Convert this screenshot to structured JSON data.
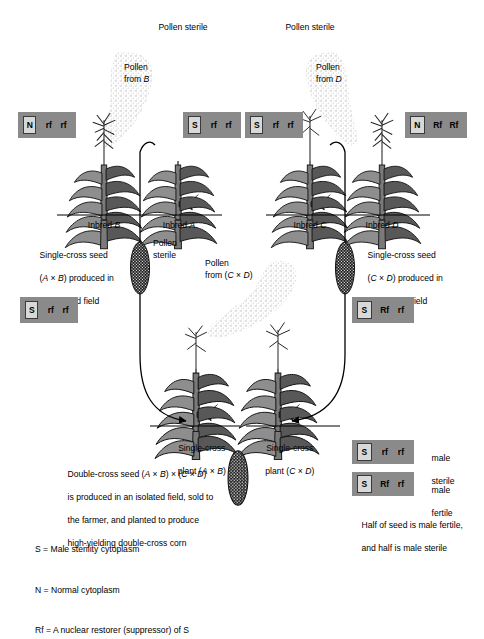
{
  "figure": {
    "type": "diagram"
  },
  "top_row": {
    "pollen_sterile_left": "Pollen sterile",
    "pollen_sterile_right": "Pollen sterile",
    "pollen_from_b": "Pollen\nfrom B",
    "pollen_from_d": "Pollen\nfrom D",
    "genotypes": [
      {
        "name": "inbred-b-genotype",
        "cytoplasm": "N",
        "allele1": "rf",
        "allele2": "rf"
      },
      {
        "name": "inbred-a-genotype",
        "cytoplasm": "S",
        "allele1": "rf",
        "allele2": "rf"
      },
      {
        "name": "inbred-c-genotype",
        "cytoplasm": "S",
        "allele1": "rf",
        "allele2": "rf"
      },
      {
        "name": "inbred-d-genotype",
        "cytoplasm": "N",
        "allele1": "Rf",
        "allele2": "Rf"
      }
    ],
    "plant_labels": [
      {
        "prefix": "Inbred ",
        "italic": "B"
      },
      {
        "prefix": "Inbred ",
        "italic": "A"
      },
      {
        "prefix": "Inbred ",
        "italic": "C"
      },
      {
        "prefix": "Inbred ",
        "italic": "D"
      }
    ]
  },
  "middle_row": {
    "seed_note_left_l1": "Single-cross seed",
    "seed_note_left_l2": "(A × B) produced in",
    "seed_note_left_l3": "an isolated field",
    "seed_note_right_l1": "Single-cross seed",
    "seed_note_right_l2": "(C × D) produced in",
    "seed_note_right_l3": "an isolated field",
    "pollen_sterile": "Pollen\nsterile",
    "pollen_from_cd": "Pollen\nfrom (C × D)",
    "genotypes": [
      {
        "name": "single-cross-ab-genotype",
        "cytoplasm": "S",
        "allele1": "rf",
        "allele2": "rf"
      },
      {
        "name": "single-cross-cd-genotype",
        "cytoplasm": "S",
        "allele1": "Rf",
        "allele2": "rf"
      }
    ],
    "plant_label_left_l1": "Single-cross",
    "plant_label_left_l2": "plant (A × B)",
    "plant_label_right_l1": "Single-cross",
    "plant_label_right_l2": "plant (C × D)"
  },
  "bottom": {
    "double_cross_l1": "Double-cross seed (A × B) × (C × D)",
    "double_cross_l2": "is produced in an isolated field, sold to",
    "double_cross_l3": "the farmer, and planted to produce",
    "double_cross_l4": "high-yielding double-cross corn"
  },
  "key": {
    "lines": [
      "S = Male sterility cytoplasm",
      "N = Normal cytoplasm",
      "Rf = A nuclear restorer (suppressor) of S"
    ]
  },
  "legend_box": {
    "rows": [
      {
        "cytoplasm": "S",
        "allele1": "rf",
        "allele2": "rf",
        "desc_l1": "male",
        "desc_l2": "sterile"
      },
      {
        "cytoplasm": "S",
        "allele1": "Rf",
        "allele2": "rf",
        "desc_l1": "male",
        "desc_l2": "fertile"
      }
    ],
    "caption_l1": "Half of seed is male fertile,",
    "caption_l2": "and half is male sterile"
  },
  "colors": {
    "box_fill": "#8a8a8a",
    "cyto_fill": "#d8d8d8",
    "plant_dark": "#2b2b2b",
    "plant_mid": "#6e6e6e",
    "plant_light": "#9e9e9e",
    "pollen_cloud": "#d9d9d9",
    "line": "#000000",
    "background": "#ffffff"
  }
}
